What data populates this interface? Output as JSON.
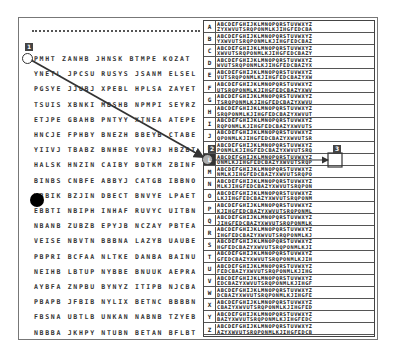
{
  "figure": {
    "left_panel": {
      "header": "-------------------------------------",
      "rows": [
        "PMHT ZANHB JHNSK BTMPE KOZAT",
        "YNETL JPCSU RUSYS JSANM ELSEL",
        "PGSYE JJUBJ XPEBL HPLSA ZAYET",
        "TSUIS XBNKI MBSHB NPMPI SEYRZ",
        "ETJPE GBAHB PNTYY XTNEA ATEPE",
        "HNCJE FPHBY BNEZH BBEYB CTABE",
        "YIIVJ TBABZ BNHBE YOVRJ HBZBT",
        "HALSK HNZIN CAIBY BDTKM ZBINF",
        "BINBS CNBFE ABBYJ CATGB IBBNO",
        "WBBIK BZJIN DBECT BNVYE LPAET",
        "EBBTI NBIPH INHAF RUVYC UITBN",
        "NBANB ZUBZB EPYJB NCZAY PBTEA",
        "VEISE NBVTN BBBNA LAZYB UAUBE",
        "PBPRI BCFAA NLTKE DANBA BAINU",
        "NEIHB LBTUP NYBBE BNUUK AEPRA",
        "AYBFA ZNPBU BYNYZ ITIPB NJCBA",
        "PBAPB JFBIB NYLIX BETNC BBBBN",
        "FBSNA UBTLB UNKAN NABNB TZYEB",
        "NBBBA JKHPY NTUBN BETAN BFLBT"
      ]
    },
    "right_panel": {
      "title": "Tabula recta",
      "header_alphabet": "ABCDEFGHIJKLMNOPQRSTUVWXYZ",
      "highlighted_row": "L",
      "rows": [
        {
          "key": "A",
          "top": "ABCDEFGHIJKLMNOPQRSTUVWXYZ",
          "bottom": "ZYXWVUTSRQPONMLKJIHGFEDCBA"
        },
        {
          "key": "B",
          "top": "ABCDEFGHIJKLMNOPQRSTUVWXYZ",
          "bottom": "YXWVUTSRQPONMLKJIHGFEDCBAZ"
        },
        {
          "key": "C",
          "top": "ABCDEFGHIJKLMNOPQRSTUVWXYZ",
          "bottom": "XWVUTSRQPONMLKJIHGFEDCBAZY"
        },
        {
          "key": "D",
          "top": "ABCDEFGHIJKLMNOPQRSTUVWXYZ",
          "bottom": "WVUTSRQPONMLKJIHGFEDCBAZYX"
        },
        {
          "key": "E",
          "top": "ABCDEFGHIJKLMNOPQRSTUVWXYZ",
          "bottom": "VUTSRQPONMLKJIHGFEDCBAZYXW"
        },
        {
          "key": "F",
          "top": "ABCDEFGHIJKLMNOPQRSTUVWXYZ",
          "bottom": "UTSRQPONMLKJIHGFEDCBAZYXWV"
        },
        {
          "key": "G",
          "top": "ABCDEFGHIJKLMNOPQRSTUVWXYZ",
          "bottom": "TSRQPONMLKJIHGFEDCBAZYXWVU"
        },
        {
          "key": "H",
          "top": "ABCDEFGHIJKLMNOPQRSTUVWXYZ",
          "bottom": "SRQPONMLKJIHGFEDCBAZYXWVUT"
        },
        {
          "key": "I",
          "top": "ABCDEFGHIJKLMNOPQRSTUVWXYZ",
          "bottom": "RQPONMLKJIHGFEDCBAZYXWVUTS"
        },
        {
          "key": "J",
          "top": "ABCDEFGHIJKLMNOPQRSTUVWXYZ",
          "bottom": "QPONMLKJIHGFEDCBAZYXWVUTSR"
        },
        {
          "key": "K",
          "top": "ABCDEFGHIJKLMNOPQRSTUVWXYZ",
          "bottom": "PONMLKJIHGFEDCBAZYXWVUTSRQ"
        },
        {
          "key": "L",
          "top": "ABCDEFGHIJKLMNOPQRSTUVWXYZ",
          "bottom": "ONMLKJIHGFEDCBAZYXWVUTSRQP"
        },
        {
          "key": "M",
          "top": "ABCDEFGHIJKLMNOPQRSTUVWXYZ",
          "bottom": "NMLKJIHGFEDCBAZYXWVUTSRQPO"
        },
        {
          "key": "N",
          "top": "ABCDEFGHIJKLMNOPQRSTUVWXYZ",
          "bottom": "MLKJIHGFEDCBAZYXWVUTSRQPON"
        },
        {
          "key": "O",
          "top": "ABCDEFGHIJKLMNOPQRSTUVWXYZ",
          "bottom": "LKJIHGFEDCBAZYXWVUTSRQPONM"
        },
        {
          "key": "P",
          "top": "ABCDEFGHIJKLMNOPQRSTUVWXYZ",
          "bottom": "KJIHGFEDCBAZYXWVUTSRQPONML"
        },
        {
          "key": "Q",
          "top": "ABCDEFGHIJKLMNOPQRSTUVWXYZ",
          "bottom": "JIHGFEDCBAZYXWVUTSRQPONMLK"
        },
        {
          "key": "R",
          "top": "ABCDEFGHIJKLMNOPQRSTUVWXYZ",
          "bottom": "IHGFEDCBAZYXWVUTSRQPONMLKJ"
        },
        {
          "key": "S",
          "top": "ABCDEFGHIJKLMNOPQRSTUVWXYZ",
          "bottom": "HGFEDCBAZYXWVUTSRQPONMLKJI"
        },
        {
          "key": "T",
          "top": "ABCDEFGHIJKLMNOPQRSTUVWXYZ",
          "bottom": "GFEDCBAZYXWVUTSRQPONMLKJIH"
        },
        {
          "key": "U",
          "top": "ABCDEFGHIJKLMNOPQRSTUVWXYZ",
          "bottom": "FEDCBAZYXWVUTSRQPONMLKJIHG"
        },
        {
          "key": "V",
          "top": "ABCDEFGHIJKLMNOPQRSTUVWXYZ",
          "bottom": "EDCBAZYXWVUTSRQPONMLKJIHGF"
        },
        {
          "key": "W",
          "top": "ABCDEFGHIJKLMNOPQRSTUVWXYZ",
          "bottom": "DCBAZYXWVUTSRQPONMLKJIHGFE"
        },
        {
          "key": "X",
          "top": "ABCDEFGHIJKLMNOPQRSTUVWXYZ",
          "bottom": "CBAZYXWVUTSRQPONMLKJIHGFED"
        },
        {
          "key": "Y",
          "top": "ABCDEFGHIJKLMNOPQRSTUVWXYZ",
          "bottom": "BAZYXWVUTSRQPONMLKJIHGFEDC"
        },
        {
          "key": "Z",
          "top": "ABCDEFGHIJKLMNOPQRSTUVWXYZ",
          "bottom": "AZYXWVUTSRQPONMLKJIHGFEDCB"
        }
      ]
    },
    "overlay": {
      "markers": [
        {
          "label": "1",
          "x": 25,
          "y": 46
        },
        {
          "label": "2",
          "x": 208,
          "y": 149
        },
        {
          "label": "3",
          "x": 334,
          "y": 149
        }
      ],
      "fixations": [
        {
          "x": 28,
          "y": 57
        },
        {
          "x": 208,
          "y": 160
        },
        {
          "x": 335,
          "y": 160
        }
      ],
      "blob": {
        "x": 37,
        "y": 200
      }
    },
    "colors": {
      "ink": "#333333",
      "frame": "#777777",
      "background": "#ffffff"
    }
  }
}
